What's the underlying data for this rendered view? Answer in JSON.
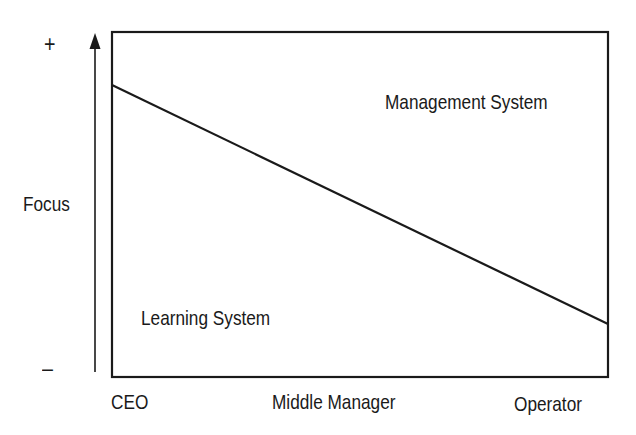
{
  "diagram": {
    "y_axis": {
      "label": "Focus",
      "top_marker": "+",
      "bottom_marker": "–"
    },
    "x_axis": {
      "labels": [
        "CEO",
        "Middle Manager",
        "Operator"
      ]
    },
    "regions": {
      "upper": "Management System",
      "lower": "Learning System"
    },
    "divider_line": {
      "from": "CEO (high)",
      "to": "Operator (low)"
    },
    "colors": {
      "stroke": "#1a1a1a",
      "background": "#ffffff"
    }
  }
}
